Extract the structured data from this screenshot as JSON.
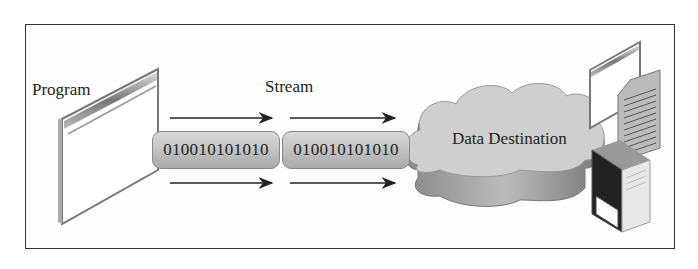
{
  "diagram": {
    "type": "stream-flow",
    "labels": {
      "source": "Program",
      "stream": "Stream",
      "destination": "Data Destination"
    },
    "stream_segments": [
      {
        "bits": "010010101010"
      },
      {
        "bits": "010010101010"
      }
    ],
    "arrows": [
      {
        "position": "top-left",
        "direction": "right"
      },
      {
        "position": "top-right",
        "direction": "right"
      },
      {
        "position": "bottom-left",
        "direction": "right"
      },
      {
        "position": "bottom-right",
        "direction": "right"
      }
    ],
    "destination_icons": [
      "window-icon",
      "document-icon",
      "server-icon"
    ],
    "colors": {
      "pill": "#bdbdbd",
      "cloud": "#c8c8c8",
      "border": "#333333"
    }
  }
}
